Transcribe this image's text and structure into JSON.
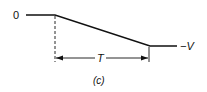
{
  "diagram": {
    "level_high_label": "0",
    "level_low_label": "−V",
    "duration_label": "T",
    "caption": "(c)",
    "line_color": "#111111"
  }
}
